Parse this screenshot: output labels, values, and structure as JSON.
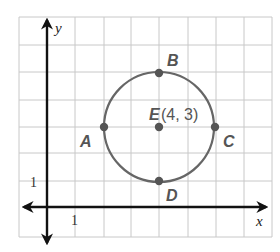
{
  "diagram": {
    "axes": {
      "x_label": "x",
      "y_label": "y",
      "x_tick_label": "1",
      "y_tick_label": "1"
    },
    "circle": {
      "center_label": "E",
      "center_coords": "(4, 3)",
      "radius_units": 2,
      "color": "#666666"
    },
    "points": [
      {
        "label": "A",
        "x": 2,
        "y": 3
      },
      {
        "label": "B",
        "x": 4,
        "y": 5
      },
      {
        "label": "C",
        "x": 6,
        "y": 3
      },
      {
        "label": "D",
        "x": 4,
        "y": 1
      },
      {
        "label": "E",
        "x": 4,
        "y": 3
      }
    ],
    "grid": {
      "x_range": [
        -1,
        8
      ],
      "y_range": [
        -1,
        7
      ]
    }
  }
}
